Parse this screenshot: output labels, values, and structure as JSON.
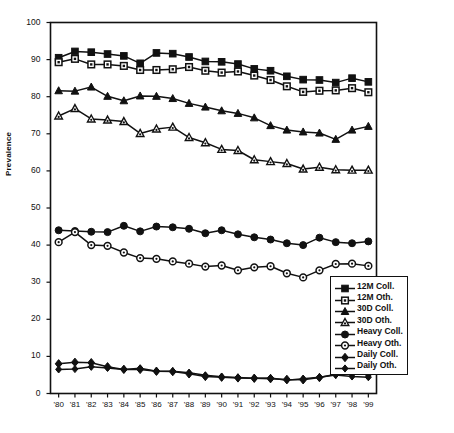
{
  "chart_data": {
    "type": "line",
    "title": "",
    "xlabel": "",
    "ylabel": "Prevalence",
    "grid": false,
    "legend_position": "right-lower",
    "ylim": [
      0,
      100
    ],
    "yticks": [
      0,
      10,
      20,
      30,
      40,
      50,
      60,
      70,
      80,
      90,
      100
    ],
    "categories": [
      "'80",
      "'81",
      "'82",
      "'83",
      "'84",
      "'85",
      "'86",
      "'87",
      "'88",
      "'89",
      "'90",
      "'91",
      "'92",
      "'93",
      "'94",
      "'95",
      "'96",
      "'97",
      "'98",
      "'99"
    ],
    "x": [
      1980,
      1981,
      1982,
      1983,
      1984,
      1985,
      1986,
      1987,
      1988,
      1989,
      1990,
      1991,
      1992,
      1993,
      1994,
      1995,
      1996,
      1997,
      1998,
      1999
    ],
    "series": [
      {
        "name": "12M Coll.",
        "marker": "filled-square",
        "color": "#111111",
        "values": [
          90.5,
          92.2,
          92.0,
          91.5,
          91.0,
          89.0,
          91.8,
          91.6,
          90.7,
          89.5,
          89.4,
          88.8,
          87.5,
          87.0,
          85.5,
          84.6,
          84.5,
          83.8,
          85.0,
          84.0
        ]
      },
      {
        "name": "12M Oth.",
        "marker": "open-square",
        "color": "#111111",
        "values": [
          89.3,
          90.2,
          88.7,
          88.7,
          88.3,
          87.2,
          87.2,
          87.4,
          88.0,
          87.0,
          86.5,
          86.8,
          85.7,
          84.5,
          82.8,
          81.3,
          81.6,
          81.7,
          82.3,
          81.2
        ]
      },
      {
        "name": "30D Coll.",
        "marker": "filled-triangle",
        "color": "#111111",
        "values": [
          81.6,
          81.5,
          82.6,
          80.1,
          78.9,
          80.2,
          80.1,
          79.5,
          78.2,
          77.2,
          76.2,
          75.5,
          74.3,
          72.2,
          71.0,
          70.5,
          70.2,
          68.5,
          71.0,
          72.0
        ]
      },
      {
        "name": "30D Oth.",
        "marker": "open-triangle",
        "color": "#111111",
        "values": [
          74.8,
          76.8,
          74.0,
          73.7,
          73.3,
          70.1,
          71.3,
          71.8,
          69.0,
          67.6,
          65.8,
          65.5,
          63.0,
          62.5,
          62.0,
          60.5,
          61.0,
          60.3,
          60.2,
          60.2
        ]
      },
      {
        "name": "Heavy Coll.",
        "marker": "filled-circle",
        "color": "#111111",
        "values": [
          44.0,
          43.8,
          43.6,
          43.5,
          45.2,
          43.7,
          45.0,
          44.8,
          44.4,
          43.2,
          44.0,
          42.9,
          42.1,
          41.5,
          40.5,
          40.0,
          42.0,
          40.8,
          40.5,
          41.0
        ]
      },
      {
        "name": "Heavy Oth.",
        "marker": "open-circle",
        "color": "#111111",
        "values": [
          40.8,
          43.5,
          40.0,
          39.8,
          38.0,
          36.5,
          36.3,
          35.6,
          35.0,
          34.2,
          34.5,
          33.2,
          34.0,
          34.3,
          32.4,
          31.3,
          33.2,
          34.9,
          35.0,
          34.4
        ]
      },
      {
        "name": "Daily Coll.",
        "marker": "filled-diamond",
        "color": "#111111",
        "values": [
          8.0,
          8.4,
          8.3,
          7.2,
          6.5,
          6.5,
          6.0,
          5.9,
          5.3,
          4.6,
          4.4,
          4.2,
          4.1,
          4.0,
          3.8,
          3.7,
          4.3,
          5.2,
          5.6,
          5.2
        ]
      },
      {
        "name": "Daily Oth.",
        "marker": "filled-diamond-small",
        "color": "#111111",
        "values": [
          6.5,
          6.6,
          7.2,
          6.9,
          6.5,
          6.8,
          6.0,
          6.0,
          5.6,
          4.9,
          4.5,
          4.3,
          4.1,
          4.2,
          3.6,
          4.0,
          4.4,
          5.0,
          4.6,
          4.4
        ]
      }
    ]
  },
  "axis": {
    "y_label": "Prevalence",
    "y_ticks": [
      "0",
      "10",
      "20",
      "30",
      "40",
      "50",
      "60",
      "70",
      "80",
      "90",
      "100"
    ],
    "x_ticks": [
      "'80",
      "'81",
      "'82",
      "'83",
      "'84",
      "'85",
      "'86",
      "'87",
      "'88",
      "'89",
      "'90",
      "'91",
      "'92",
      "'93",
      "'94",
      "'95",
      "'96",
      "'97",
      "'98",
      "'99"
    ]
  },
  "legend": {
    "items": [
      {
        "label": "12M Coll."
      },
      {
        "label": "12M Oth."
      },
      {
        "label": "30D Coll."
      },
      {
        "label": "30D Oth."
      },
      {
        "label": "Heavy Coll."
      },
      {
        "label": "Heavy Oth."
      },
      {
        "label": "Daily Coll."
      },
      {
        "label": "Daily Oth."
      }
    ]
  }
}
